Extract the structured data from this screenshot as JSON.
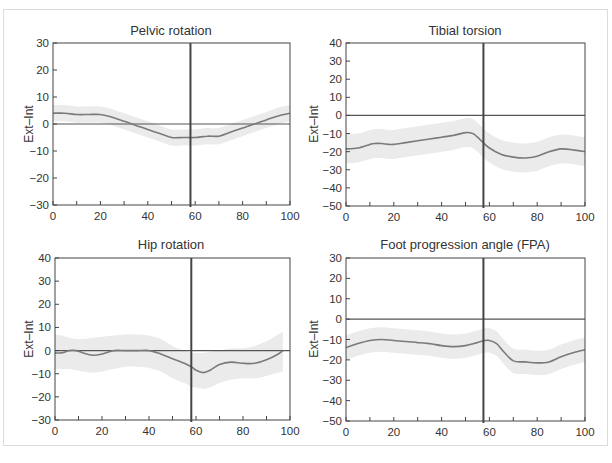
{
  "figure": {
    "colors": {
      "band": "#ebebeb",
      "mean_line": "#7a7a7a",
      "axis": "#444444",
      "zero_line": "#555555",
      "toe_off_line": "#444444",
      "frame": "#dcdcdc"
    }
  },
  "chart_data": [
    {
      "id": "pelvic",
      "type": "line",
      "title": "Pelvic rotation",
      "xlabel": "",
      "ylabel": "Ext–Int",
      "xlim": [
        0,
        100
      ],
      "ylim": [
        -30,
        30
      ],
      "xticks": [
        0,
        20,
        40,
        60,
        80,
        100
      ],
      "xminor": [
        10,
        30,
        50,
        70,
        90
      ],
      "yticks": [
        30,
        20,
        10,
        0,
        -10,
        -20,
        -30
      ],
      "yminor": [],
      "toe_off": 58,
      "box": [
        53,
        43,
        290,
        205
      ],
      "x": [
        0,
        5,
        10,
        15,
        20,
        25,
        30,
        35,
        40,
        45,
        50,
        55,
        60,
        65,
        70,
        75,
        80,
        85,
        90,
        95,
        100
      ],
      "mean": [
        4,
        4,
        3.5,
        3.5,
        3.5,
        2.5,
        1,
        -0.5,
        -2,
        -3.5,
        -5,
        -5,
        -5,
        -4.5,
        -4.5,
        -3,
        -1.5,
        0,
        1.5,
        3,
        4
      ],
      "sd": [
        3,
        3,
        3,
        3,
        3,
        3,
        3,
        3,
        3,
        3,
        3,
        3,
        3,
        3,
        3,
        3,
        3,
        3,
        3,
        3,
        3
      ]
    },
    {
      "id": "tibial",
      "type": "line",
      "title": "Tibial torsion",
      "xlabel": "",
      "ylabel": "Ext–Int",
      "xlim": [
        0,
        100
      ],
      "ylim": [
        -50,
        40
      ],
      "xticks": [
        0,
        20,
        40,
        60,
        80,
        100
      ],
      "xminor": [
        10,
        30,
        50,
        70,
        90
      ],
      "yticks": [
        40,
        30,
        20,
        10,
        0,
        -10,
        -20,
        -30,
        -40,
        -50
      ],
      "yminor": [],
      "toe_off": 57.5,
      "box": [
        346,
        43,
        585,
        206
      ],
      "x": [
        0,
        5,
        10,
        12,
        15,
        18,
        20,
        25,
        30,
        35,
        40,
        45,
        50,
        53,
        55,
        57,
        60,
        65,
        70,
        75,
        80,
        85,
        90,
        95,
        100
      ],
      "mean": [
        -18.5,
        -18,
        -16,
        -15.5,
        -15.5,
        -16,
        -16,
        -15,
        -14,
        -13,
        -12,
        -11,
        -9.5,
        -10,
        -12,
        -14.5,
        -18,
        -21.5,
        -23,
        -23.5,
        -22.5,
        -20,
        -18.5,
        -19,
        -20
      ],
      "sd": [
        8,
        8,
        8,
        8,
        8,
        8,
        8,
        8,
        8,
        8,
        8,
        8,
        8,
        8,
        8,
        8,
        8,
        8,
        8,
        8,
        8,
        8,
        8,
        8,
        8
      ]
    },
    {
      "id": "hip",
      "type": "line",
      "title": "Hip rotation",
      "xlabel": "",
      "ylabel": "Ext–Int",
      "xlim": [
        0,
        100
      ],
      "ylim": [
        -30,
        40
      ],
      "xticks": [
        0,
        20,
        40,
        60,
        80,
        100
      ],
      "xminor": [
        10,
        30,
        50,
        70,
        90
      ],
      "yticks": [
        40,
        30,
        20,
        10,
        0,
        -10,
        -20,
        -30
      ],
      "yminor": [],
      "toe_off": 58,
      "box": [
        55,
        258,
        290,
        420
      ],
      "x": [
        0,
        3,
        6,
        9,
        12,
        16,
        20,
        25,
        30,
        35,
        40,
        45,
        50,
        55,
        58,
        60,
        63,
        66,
        70,
        75,
        80,
        85,
        90,
        95,
        97
      ],
      "mean": [
        -1,
        -1,
        0,
        0,
        -1,
        -2,
        -1.5,
        0,
        0,
        0,
        0,
        -1.5,
        -3.5,
        -5.5,
        -7,
        -8.5,
        -9.5,
        -8.5,
        -6,
        -5,
        -5.5,
        -5.5,
        -4,
        -1.5,
        0
      ],
      "upper": [
        7,
        6.5,
        5.5,
        5,
        5,
        5.5,
        6,
        6.5,
        7,
        7,
        6.5,
        5,
        2,
        0,
        -1,
        -1,
        -1,
        -0.5,
        0,
        1,
        1,
        2,
        4,
        7,
        8
      ],
      "lower": [
        -8,
        -8,
        -8,
        -8.5,
        -9,
        -9.5,
        -9,
        -8,
        -7,
        -7,
        -7.5,
        -9,
        -12,
        -14,
        -15.5,
        -16,
        -16.5,
        -16,
        -14,
        -12.5,
        -12,
        -12,
        -11,
        -9.5,
        -9
      ]
    },
    {
      "id": "fpa",
      "type": "line",
      "title": "Foot progression angle (FPA)",
      "xlabel": "",
      "ylabel": "Ext–Int",
      "xlim": [
        0,
        100
      ],
      "ylim": [
        -50,
        30
      ],
      "xticks": [
        0,
        20,
        40,
        60,
        80,
        100
      ],
      "xminor": [
        10,
        30,
        50,
        70,
        90
      ],
      "yticks": [
        30,
        20,
        10,
        0,
        -10,
        -20,
        -30,
        -40,
        -50
      ],
      "yminor": [],
      "toe_off": 57.5,
      "box": [
        346,
        258,
        585,
        421
      ],
      "x": [
        0,
        5,
        10,
        15,
        20,
        25,
        30,
        35,
        40,
        45,
        50,
        55,
        58,
        60,
        63,
        66,
        70,
        75,
        80,
        85,
        90,
        95,
        100
      ],
      "mean": [
        -14,
        -12,
        -10.5,
        -10,
        -10.5,
        -11,
        -11.5,
        -12,
        -13,
        -13.5,
        -13,
        -11.5,
        -10.5,
        -10.5,
        -12,
        -16,
        -20.5,
        -21,
        -21.5,
        -21,
        -18.5,
        -16.5,
        -15
      ],
      "sd": [
        6,
        6,
        6,
        6,
        6,
        6,
        6,
        6,
        6,
        6,
        6,
        6,
        6,
        6,
        6,
        6,
        6,
        6,
        6,
        6,
        6,
        6,
        6
      ]
    }
  ]
}
